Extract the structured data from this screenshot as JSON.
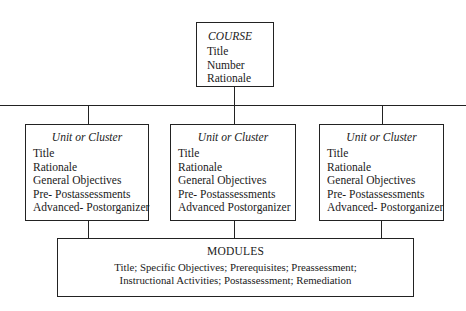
{
  "course": {
    "title": "COURSE",
    "items": [
      "Title",
      "Number",
      "Rationale"
    ]
  },
  "units": [
    {
      "title": "Unit or Cluster",
      "items": [
        "Title",
        "Rationale",
        "General Objectives",
        "Pre- Postassessments",
        "Advanced- Postorganizer"
      ]
    },
    {
      "title": "Unit or Cluster",
      "items": [
        "Title",
        "Rationale",
        "General Objectives",
        "Pre- Postassessments",
        "Advanced Postorganizer"
      ]
    },
    {
      "title": "Unit or Cluster",
      "items": [
        "Title",
        "Rationale",
        "General Objectives",
        "Pre- Postassessments",
        "Advanced- Postorganizer"
      ]
    }
  ],
  "modules": {
    "title": "MODULES",
    "line1": "Title; Specific Objectives; Prerequisites; Preassessment;",
    "line2": "Instructional Activities; Postassessment; Remediation"
  }
}
